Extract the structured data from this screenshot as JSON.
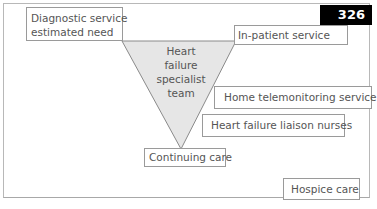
{
  "figure": {
    "page_number": "326",
    "colors": {
      "badge_bg": "#000000",
      "badge_text": "#ffffff",
      "triangle_fill": "#e6e6e6",
      "border": "#9a9a9a"
    }
  },
  "diagram": {
    "triangle": {
      "label_lines": [
        "Heart",
        "failure",
        "specialist",
        "team"
      ]
    },
    "boxes": {
      "diagnostic": {
        "lines": [
          "Diagnostic service",
          "estimated need"
        ]
      },
      "inpatient": {
        "label": "In-patient service"
      },
      "home_telemonitoring": {
        "label": "Home telemonitoring service"
      },
      "liaison_nurses": {
        "label": "Heart failure liaison nurses"
      },
      "continuing_care": {
        "label": "Continuing care"
      },
      "hospice_care": {
        "label": "Hospice care"
      }
    }
  }
}
